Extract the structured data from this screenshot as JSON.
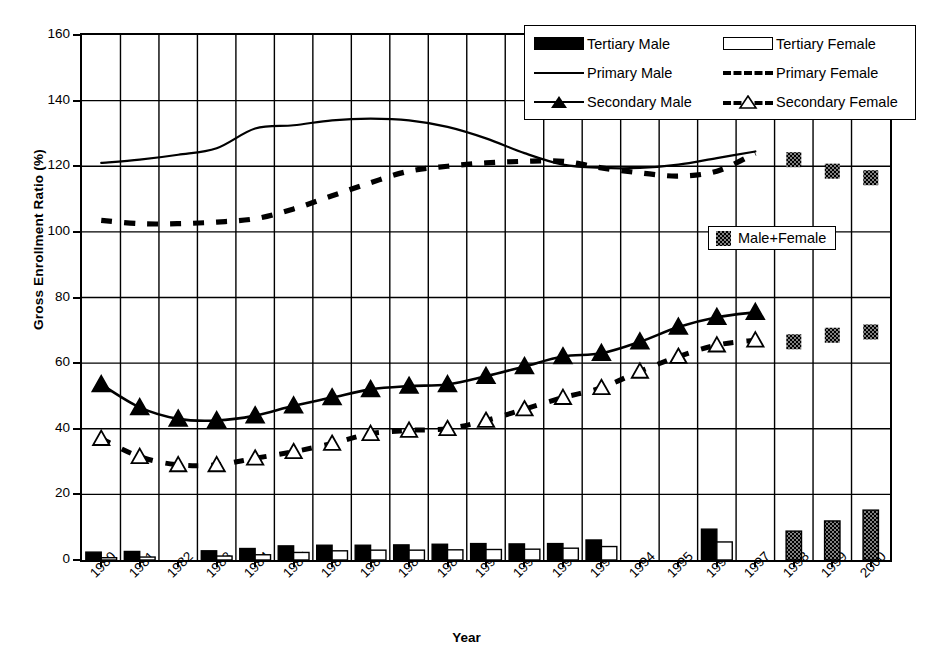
{
  "chart_data": {
    "type": "line",
    "title": "",
    "xlabel": "Year",
    "ylabel": "Gross Enrollment Ratio (%)",
    "xlim": [
      1979.5,
      2000.5
    ],
    "ylim": [
      0,
      160
    ],
    "yticks": [
      0,
      20,
      40,
      60,
      80,
      100,
      120,
      140,
      160
    ],
    "grid": "both",
    "legend_position": "top-right",
    "categories": [
      1980,
      1981,
      1982,
      1983,
      1984,
      1985,
      1986,
      1987,
      1988,
      1989,
      1990,
      1991,
      1992,
      1993,
      1994,
      1995,
      1996,
      1997,
      1998,
      1999,
      2000
    ],
    "series": [
      {
        "name": "Primary Male",
        "style": "solid-line",
        "marker": "none",
        "x": [
          1980,
          1981,
          1982,
          1983,
          1984,
          1985,
          1986,
          1987,
          1988,
          1989,
          1990,
          1991,
          1992,
          1993,
          1994,
          1995,
          1996,
          1997
        ],
        "values": [
          121.0,
          122.0,
          123.5,
          125.5,
          131.5,
          132.5,
          134.0,
          134.5,
          134.0,
          132.0,
          128.5,
          124.0,
          120.5,
          119.5,
          119.5,
          120.5,
          122.5,
          124.5
        ]
      },
      {
        "name": "Primary Female",
        "style": "dashed-line",
        "marker": "none",
        "x": [
          1980,
          1981,
          1982,
          1983,
          1984,
          1985,
          1986,
          1987,
          1988,
          1989,
          1990,
          1991,
          1992,
          1993,
          1994,
          1995,
          1996,
          1997
        ],
        "values": [
          103.5,
          102.5,
          102.5,
          103.0,
          104.0,
          107.0,
          111.0,
          115.0,
          118.5,
          120.0,
          121.0,
          121.5,
          121.5,
          119.5,
          118.0,
          117.0,
          118.5,
          124.0
        ]
      },
      {
        "name": "Secondary Male",
        "style": "solid-line",
        "marker": "filled-triangle",
        "x": [
          1980,
          1981,
          1982,
          1983,
          1984,
          1985,
          1986,
          1987,
          1988,
          1989,
          1990,
          1991,
          1992,
          1993,
          1994,
          1995,
          1996,
          1997
        ],
        "values": [
          53.5,
          46.5,
          43.0,
          42.5,
          44.0,
          47.0,
          49.5,
          52.0,
          53.0,
          53.5,
          56.0,
          59.0,
          62.0,
          63.0,
          66.5,
          71.0,
          74.0,
          75.5
        ]
      },
      {
        "name": "Secondary Female",
        "style": "dashed-line",
        "marker": "open-triangle",
        "x": [
          1980,
          1981,
          1982,
          1983,
          1984,
          1985,
          1986,
          1987,
          1988,
          1989,
          1990,
          1991,
          1992,
          1993,
          1994,
          1995,
          1996,
          1997
        ],
        "values": [
          37.0,
          31.5,
          29.0,
          29.0,
          31.0,
          33.0,
          35.5,
          38.5,
          39.5,
          40.0,
          42.5,
          46.0,
          49.5,
          52.5,
          57.5,
          62.0,
          65.5,
          67.0
        ]
      },
      {
        "name": "Tertiary Male",
        "style": "bar",
        "fill": "solid-black",
        "x": [
          1980,
          1981,
          1983,
          1984,
          1985,
          1986,
          1987,
          1988,
          1989,
          1990,
          1991,
          1992,
          1993,
          1996
        ],
        "values": [
          2.4,
          2.6,
          2.8,
          3.5,
          4.3,
          4.5,
          4.5,
          4.6,
          4.8,
          5.0,
          4.9,
          5.0,
          6.1,
          9.4
        ]
      },
      {
        "name": "Tertiary Female",
        "style": "bar",
        "fill": "open-white",
        "x": [
          1980,
          1981,
          1983,
          1984,
          1985,
          1986,
          1987,
          1988,
          1989,
          1990,
          1991,
          1992,
          1993,
          1996
        ],
        "values": [
          0.7,
          0.9,
          1.2,
          1.6,
          2.3,
          2.8,
          3.0,
          3.0,
          3.1,
          3.2,
          3.3,
          3.6,
          4.1,
          5.5
        ]
      },
      {
        "name": "Male+Female Primary",
        "style": "marker",
        "fill": "hatched-gray",
        "x": [
          1998,
          1999,
          2000
        ],
        "values": [
          122.0,
          118.5,
          116.5
        ]
      },
      {
        "name": "Male+Female Secondary",
        "style": "marker",
        "fill": "hatched-gray",
        "x": [
          1998,
          1999,
          2000
        ],
        "values": [
          66.5,
          68.5,
          69.5
        ]
      },
      {
        "name": "Male+Female Tertiary",
        "style": "bar",
        "fill": "hatched-gray",
        "x": [
          1998,
          1999,
          2000
        ],
        "values": [
          8.8,
          11.9,
          15.2
        ]
      }
    ]
  },
  "axes": {
    "ylabel": "Gross Enrollment Ratio (%)",
    "xlabel": "Year",
    "ytick_labels": [
      "0",
      "20",
      "40",
      "60",
      "80",
      "100",
      "120",
      "140",
      "160"
    ],
    "xtick_labels": [
      "1980",
      "1981",
      "1982",
      "1983",
      "1984",
      "1985",
      "1986",
      "1987",
      "1988",
      "1989",
      "1990",
      "1991",
      "1992",
      "1993",
      "1994",
      "1995",
      "1996",
      "1997",
      "1998",
      "1999",
      "2000"
    ]
  },
  "legend": {
    "entries": [
      {
        "label": "Tertiary Male",
        "key": "solid-black-box"
      },
      {
        "label": "Tertiary Female",
        "key": "open-white-box"
      },
      {
        "label": "Primary Male",
        "key": "solid-line"
      },
      {
        "label": "Primary Female",
        "key": "dashed-line"
      },
      {
        "label": "Secondary Male",
        "key": "solid-line-filled-triangle"
      },
      {
        "label": "Secondary Female",
        "key": "dashed-line-open-triangle"
      }
    ]
  },
  "legend_secondary": {
    "label": "Male+Female",
    "key": "hatched-gray-box"
  },
  "colors": {
    "ink": "#000000",
    "background": "#ffffff",
    "hatch_gray": "#808080"
  }
}
